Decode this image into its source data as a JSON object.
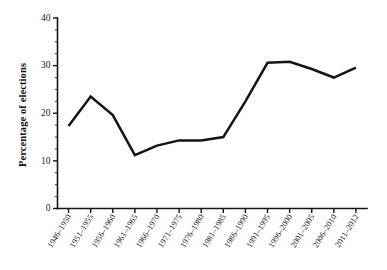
{
  "chart_data": {
    "type": "line",
    "title": "",
    "xlabel": "",
    "ylabel": "Percentage of elections",
    "categories": [
      "1946–1950",
      "1951–1955",
      "1956–1960",
      "1961–1965",
      "1966–1970",
      "1971–1975",
      "1976–1980",
      "1981–1985",
      "1986–1990",
      "1991–1995",
      "1996–2000",
      "2001–2005",
      "2006–2010",
      "2011–2012"
    ],
    "values": [
      17.3,
      23.5,
      19.6,
      11.2,
      13.2,
      14.3,
      14.3,
      15.0,
      22.5,
      30.6,
      30.8,
      29.3,
      27.5,
      29.6
    ],
    "ylim": [
      0,
      40
    ],
    "ytick_labels": [
      "0",
      "10",
      "20",
      "30",
      "40"
    ],
    "ytick_values": [
      0,
      10,
      20,
      30,
      40
    ],
    "yminor_step": 2.5,
    "grid": false,
    "legend": "none",
    "line_color": "#151515",
    "axis_color": "#141414",
    "background_color": "#ffffff"
  }
}
